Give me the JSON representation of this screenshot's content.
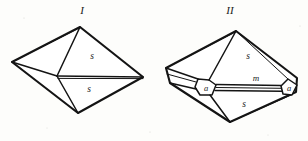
{
  "figure_plate": {
    "background_color": "#fdfdfb",
    "ink_color": "#141414",
    "width": 308,
    "height": 141,
    "description": "Two line-drawn crystal habit diagrams labelled I and II with italic face letters",
    "figures": [
      {
        "id": "figure-1",
        "label": "I",
        "label_x": 82,
        "label_y": 14,
        "face_labels": [
          {
            "name": "face-s-upper",
            "text": "s",
            "x": 92,
            "y": 59
          },
          {
            "name": "face-s-lower",
            "text": "s",
            "x": 89,
            "y": 92
          }
        ],
        "vertices": {
          "top": [
            80,
            27
          ],
          "left": [
            12,
            62
          ],
          "right": [
            143,
            77
          ],
          "bottom": [
            78,
            113
          ],
          "center": [
            57,
            76
          ]
        }
      },
      {
        "id": "figure-2",
        "label": "II",
        "label_x": 230,
        "label_y": 14,
        "face_labels": [
          {
            "name": "face-s-upper",
            "text": "s",
            "x": 248,
            "y": 59
          },
          {
            "name": "face-m-center",
            "text": "m",
            "x": 256,
            "y": 81
          },
          {
            "name": "face-a-left",
            "text": "a",
            "x": 206,
            "y": 91
          },
          {
            "name": "face-a-right",
            "text": "a",
            "x": 288,
            "y": 91
          },
          {
            "name": "face-s-lower",
            "text": "s",
            "x": 244,
            "y": 107
          }
        ],
        "vertices": {
          "top": [
            236,
            31
          ],
          "left_upper": [
            166,
            68
          ],
          "left_lower": [
            170,
            83
          ],
          "right_upper": [
            297,
            78
          ],
          "right_lower": [
            296,
            92
          ],
          "bottom": [
            230,
            122
          ]
        }
      }
    ]
  }
}
